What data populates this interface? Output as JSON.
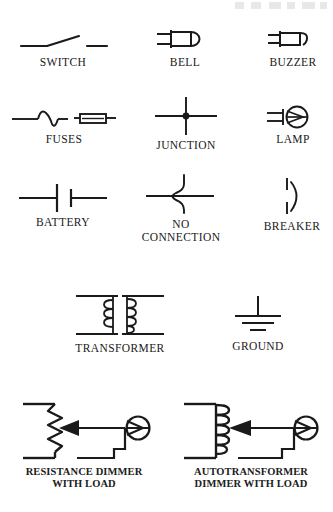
{
  "page": {
    "background_color": "#ffffff",
    "stroke_color": "#1a1a1a",
    "width": 333,
    "height": 512,
    "faint_top_right_artifact": true
  },
  "symbols": [
    {
      "id": "switch",
      "label": "SWITCH",
      "icon": "switch-symbol",
      "row": 1,
      "column": 1,
      "description": "Open single-pole switch: lead, hinged blade angled up, gap, second lead"
    },
    {
      "id": "bell",
      "label": "BELL",
      "icon": "bell-symbol",
      "row": 1,
      "column": 2,
      "description": "Two leads joined by a bar, rectangle body, domed circle at right"
    },
    {
      "id": "buzzer",
      "label": "BUZZER",
      "icon": "buzzer-symbol",
      "row": 1,
      "column": 3,
      "description": "Two leads joined by a bar, rectangle body, hooked flag at right"
    },
    {
      "id": "fuses",
      "label": "FUSES",
      "icon": "fuses-symbol",
      "row": 2,
      "column": 1,
      "description": "Two fuse styles: S-curve element fuse and cartridge fuse rectangle"
    },
    {
      "id": "junction",
      "label": "JUNCTION",
      "icon": "junction-symbol",
      "row": 2,
      "column": 2,
      "description": "Crossing wires with a solid connection dot at the intersection"
    },
    {
      "id": "lamp",
      "label": "LAMP",
      "icon": "lamp-symbol",
      "row": 2,
      "column": 3,
      "description": "Two leads joined by a bar into a circle containing a pointed wedge"
    },
    {
      "id": "battery",
      "label": "BATTERY",
      "icon": "battery-symbol",
      "row": 3,
      "column": 1,
      "description": "Long plate and short plate between two leads"
    },
    {
      "id": "no-connection",
      "label": "NO\nCONNECTION",
      "icon": "no-connection-symbol",
      "row": 3,
      "column": 2,
      "description": "Horizontal wire with vertical wire hopping over it in a loop"
    },
    {
      "id": "breaker",
      "label": "BREAKER",
      "icon": "breaker-symbol",
      "row": 3,
      "column": 3,
      "description": "Broken vertical wire with curved arc alongside"
    },
    {
      "id": "transformer",
      "label": "TRANSFORMER",
      "icon": "transformer-symbol",
      "row": 4,
      "column": 1,
      "description": "Two facing coil windings with core line between, bars top and bottom"
    },
    {
      "id": "ground",
      "label": "GROUND",
      "icon": "ground-symbol",
      "row": 4,
      "column": 2,
      "description": "Vertical lead with three horizontal bars of decreasing width"
    },
    {
      "id": "resistance-dimmer",
      "label": "RESISTANCE DIMMER\nWITH LOAD",
      "icon": "resistance-dimmer-symbol",
      "row": 5,
      "column": 1,
      "bold_label": true,
      "description": "Zigzag rheostat with wiper arrow feeding a lamp load"
    },
    {
      "id": "autotransformer-dimmer",
      "label": "AUTOTRANSFORMER\nDIMMER WITH LOAD",
      "icon": "autotransformer-dimmer-symbol",
      "row": 5,
      "column": 2,
      "bold_label": true,
      "description": "Coil winding with wiper arrow tap feeding a lamp load"
    }
  ]
}
